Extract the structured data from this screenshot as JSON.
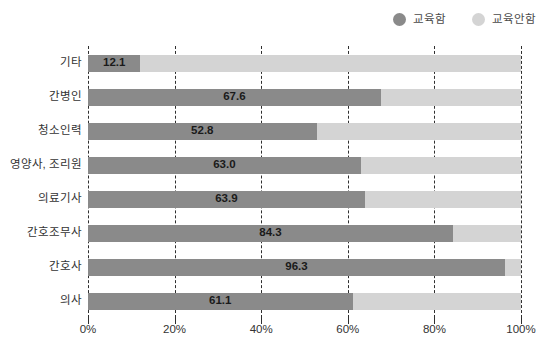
{
  "chart_data": {
    "type": "bar",
    "orientation": "horizontal",
    "stacked": true,
    "stacked_percent": true,
    "title": "",
    "subtitle": "",
    "xlabel": "",
    "ylabel": "",
    "xlim": [
      0,
      100
    ],
    "xticks": [
      0,
      20,
      40,
      60,
      80,
      100
    ],
    "xtick_labels": [
      "0%",
      "20%",
      "40%",
      "60%",
      "80%",
      "100%"
    ],
    "grid": true,
    "grid_style": "dashed-vertical",
    "legend_position": "top-right",
    "categories": [
      "기타",
      "간병인",
      "청소인력",
      "영양사, 조리원",
      "의료기사",
      "간호조무사",
      "간호사",
      "의사"
    ],
    "series": [
      {
        "name": "교육함",
        "color": "#8a8a8a",
        "values": [
          12.1,
          67.6,
          52.8,
          63.0,
          63.9,
          84.3,
          96.3,
          61.1
        ],
        "labels": [
          "12.1",
          "67.6",
          "52.8",
          "63.0",
          "63.9",
          "84.3",
          "96.3",
          "61.1"
        ]
      },
      {
        "name": "교육안함",
        "color": "#d4d4d4",
        "values": [
          87.9,
          32.4,
          47.2,
          37.0,
          36.1,
          15.7,
          3.7,
          38.9
        ],
        "labels": [
          "",
          "",
          "",
          "",
          "",
          "",
          "",
          ""
        ]
      }
    ]
  },
  "legend": {
    "items": [
      {
        "label": "교육함",
        "color": "#8a8a8a"
      },
      {
        "label": "교육안함",
        "color": "#d4d4d4"
      }
    ]
  },
  "colors": {
    "series_educated": "#8a8a8a",
    "series_not_educated": "#d4d4d4",
    "gridline": "#2f2f2f",
    "text": "#333333",
    "value_text": "#1a1a1a",
    "background": "#ffffff"
  }
}
